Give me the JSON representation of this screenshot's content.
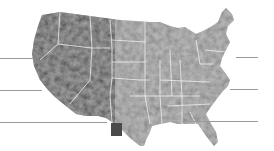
{
  "map": {
    "subject": "United States shaded-relief map",
    "style": "grayscale",
    "colors": {
      "background": "#ffffff",
      "land_west_relief": "#b9b9b9",
      "land_east": "#c4c4c4",
      "state_borders": "#eeeeee",
      "highlight_region": "#4a4a4a",
      "leader_lines": "#9a9a9a"
    },
    "highlight": {
      "name": "highlighted-region-southwest-texas",
      "x": 111,
      "y": 123,
      "w": 11,
      "h": 13
    },
    "leader_lines": {
      "left": [
        {
          "y": 58,
          "x1": 0,
          "x2": 34
        },
        {
          "y": 90,
          "x1": 0,
          "x2": 42
        },
        {
          "y": 122,
          "x1": 0,
          "x2": 107
        }
      ],
      "right": [
        {
          "y": 57,
          "x1": 236,
          "x2": 258
        },
        {
          "y": 89,
          "x1": 230,
          "x2": 258
        },
        {
          "y": 121,
          "x1": 182,
          "x2": 258
        }
      ]
    }
  }
}
